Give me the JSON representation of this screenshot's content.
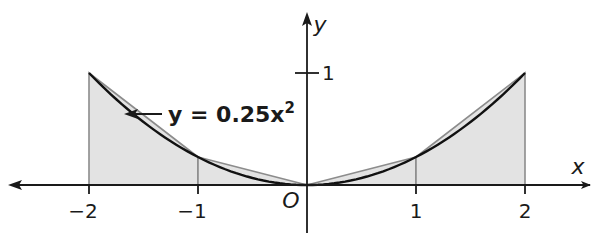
{
  "chart_data": {
    "type": "area",
    "title": "",
    "curve_label": "y = 0.25x",
    "curve_label_exponent": "2",
    "function": "y = 0.25x^2",
    "xlabel": "x",
    "ylabel": "y",
    "origin_label": "O",
    "xlim": [
      -2.7,
      2.6
    ],
    "ylim": [
      -0.4,
      1.55
    ],
    "grid": false,
    "x_ticks": [
      {
        "value": -2,
        "label": "−2"
      },
      {
        "value": -1,
        "label": "−1"
      },
      {
        "value": 1,
        "label": "1"
      },
      {
        "value": 2,
        "label": "2"
      }
    ],
    "y_ticks": [
      {
        "value": 1,
        "label": "1"
      }
    ],
    "curve_points": [
      {
        "x": -2,
        "y": 1
      },
      {
        "x": -1.5,
        "y": 0.5625
      },
      {
        "x": -1,
        "y": 0.25
      },
      {
        "x": -0.5,
        "y": 0.0625
      },
      {
        "x": 0,
        "y": 0
      },
      {
        "x": 0.5,
        "y": 0.0625
      },
      {
        "x": 1,
        "y": 0.25
      },
      {
        "x": 1.5,
        "y": 0.5625
      },
      {
        "x": 2,
        "y": 1
      }
    ],
    "trapezoids": [
      {
        "x0": -2,
        "x1": -1,
        "y0": 1,
        "y1": 0.25
      },
      {
        "x0": -1,
        "x1": 0,
        "y0": 0.25,
        "y1": 0
      },
      {
        "x0": 0,
        "x1": 1,
        "y0": 0,
        "y1": 0.25
      },
      {
        "x0": 1,
        "x1": 2,
        "y0": 0.25,
        "y1": 1
      }
    ],
    "colors": {
      "curve": "#111111",
      "trapezoid_fill": "#e3e3e3",
      "trapezoid_edge": "#8c8c8c",
      "axis": "#1a1a1a"
    }
  }
}
